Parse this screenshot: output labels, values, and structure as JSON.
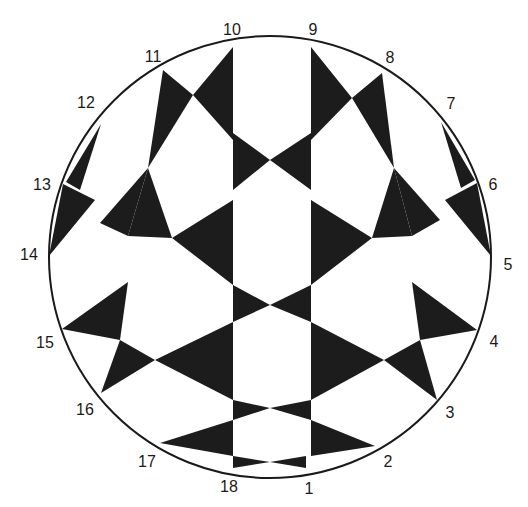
{
  "diagram": {
    "type": "circular 18-point star pattern",
    "colors": {
      "fill": "#1c1c1c",
      "stroke": "#1a1a1a",
      "background": "#ffffff"
    },
    "circle": {
      "cx": 270,
      "cy": 257,
      "r": 221
    },
    "points": [
      {
        "id": "1",
        "label": "1",
        "x": 306,
        "y": 468,
        "lx": 309,
        "ly": 494
      },
      {
        "id": "2",
        "label": "2",
        "x": 375,
        "y": 446,
        "lx": 388,
        "ly": 467
      },
      {
        "id": "3",
        "label": "3",
        "x": 437,
        "y": 400,
        "lx": 450,
        "ly": 418
      },
      {
        "id": "4",
        "label": "4",
        "x": 477,
        "y": 330,
        "lx": 494,
        "ly": 347
      },
      {
        "id": "5",
        "label": "5",
        "x": 491,
        "y": 256,
        "lx": 508,
        "ly": 270
      },
      {
        "id": "6",
        "label": "6",
        "x": 477,
        "y": 183,
        "lx": 493,
        "ly": 190
      },
      {
        "id": "7",
        "label": "7",
        "x": 441,
        "y": 122,
        "lx": 451,
        "ly": 109
      },
      {
        "id": "8",
        "label": "8",
        "x": 382,
        "y": 73,
        "lx": 390,
        "ly": 63
      },
      {
        "id": "9",
        "label": "9",
        "x": 311,
        "y": 47,
        "lx": 313,
        "ly": 35
      },
      {
        "id": "10",
        "label": "10",
        "x": 233,
        "y": 47,
        "lx": 232,
        "ly": 35
      },
      {
        "id": "11",
        "label": "11",
        "x": 163,
        "y": 70,
        "lx": 153,
        "ly": 62
      },
      {
        "id": "12",
        "label": "12",
        "x": 101,
        "y": 124,
        "lx": 86,
        "ly": 108
      },
      {
        "id": "13",
        "label": "13",
        "x": 63,
        "y": 184,
        "lx": 42,
        "ly": 190
      },
      {
        "id": "14",
        "label": "14",
        "x": 49,
        "y": 256,
        "lx": 29,
        "ly": 260
      },
      {
        "id": "15",
        "label": "15",
        "x": 62,
        "y": 329,
        "lx": 45,
        "ly": 348
      },
      {
        "id": "16",
        "label": "16",
        "x": 101,
        "y": 393,
        "lx": 85,
        "ly": 415
      },
      {
        "id": "17",
        "label": "17",
        "x": 160,
        "y": 443,
        "lx": 147,
        "ly": 467
      },
      {
        "id": "18",
        "label": "18",
        "x": 230,
        "y": 468,
        "lx": 229,
        "ly": 492
      }
    ],
    "triangles": [
      "233,47 233,140 193,95",
      "163,70 193,95 148,168",
      "311,47 311,140 352,98",
      "382,73 352,98 394,168",
      "233,133 270,160 233,190",
      "311,133 270,160 311,190",
      "148,168 100,223 128,236",
      "148,168 128,236 172,238",
      "394,168 440,220 412,236",
      "394,168 412,236 372,238",
      "172,238 233,200 233,285",
      "372,238 311,200 311,285",
      "63,184 95,200 49,256",
      "477,183 445,200 491,256",
      "101,124 66,182 80,190",
      "441,122 475,180 461,188",
      "233,285 270,305 233,322",
      "311,285 270,305 311,322",
      "128,282 62,329 120,340",
      "412,282 477,330 420,340",
      "120,340 101,393 155,360",
      "420,340 437,400 384,360",
      "155,360 233,322 233,400",
      "384,360 311,322 311,400",
      "233,400 270,408 233,420",
      "311,400 270,408 311,420",
      "160,443 233,420 233,456",
      "375,446 311,420 311,456",
      "233,456 270,462 233,468",
      "306,456 270,462 306,468"
    ],
    "labels_note": "18 numbered points around the circumference"
  }
}
